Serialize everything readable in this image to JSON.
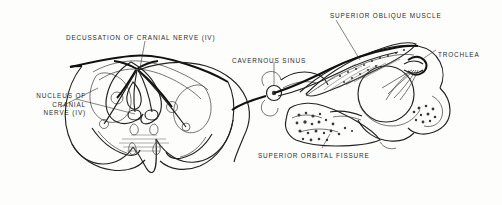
{
  "figure": {
    "type": "anatomical-line-drawing",
    "background_color": "#fdfdfb",
    "ink_color": "#1d1d1d",
    "width": 502,
    "height": 205
  },
  "labels": {
    "decussation": {
      "text": "DECUSSATION OF CRANIAL NERVE (IV)",
      "x": 66,
      "y": 34
    },
    "nucleus": {
      "line1": "NUCLEUS OF",
      "line2": "CRANIAL",
      "line3": "NERVE (IV)",
      "text": "NUCLEUS OF\nCRANIAL\nNERVE (IV)",
      "x": 12,
      "y": 92
    },
    "cavernous_sinus": {
      "text": "CAVERNOUS SINUS",
      "x": 232,
      "y": 57
    },
    "superior_oblique_muscle": {
      "text": "SUPERIOR  OBLIQUE  MUSCLE",
      "x": 330,
      "y": 12
    },
    "trochlea": {
      "text": "TROCHLEA",
      "x": 438,
      "y": 51
    },
    "superior_orbital_fissure": {
      "text": "SUPERIOR ORBITAL FISSURE",
      "x": 258,
      "y": 152
    }
  },
  "structures": [
    {
      "name": "brainstem-cross-section",
      "region": "left"
    },
    {
      "name": "cerebral-aqueduct",
      "region": "left-center"
    },
    {
      "name": "trochlear-nucleus-left",
      "region": "left-center"
    },
    {
      "name": "trochlear-nucleus-right",
      "region": "left-center"
    },
    {
      "name": "decussation-point",
      "region": "top-center-left"
    },
    {
      "name": "cerebellar-peduncle-left",
      "region": "left-lower"
    },
    {
      "name": "cerebellar-peduncle-right",
      "region": "left-lower"
    },
    {
      "name": "cavernous-sinus",
      "region": "center"
    },
    {
      "name": "sphenoid-bone",
      "region": "center-lower"
    },
    {
      "name": "orbit",
      "region": "right"
    },
    {
      "name": "eyeball",
      "region": "right"
    },
    {
      "name": "superior-oblique-muscle",
      "region": "right-upper"
    },
    {
      "name": "trochlea-pulley",
      "region": "right-upper"
    },
    {
      "name": "frontal-bone",
      "region": "right-edge"
    }
  ]
}
